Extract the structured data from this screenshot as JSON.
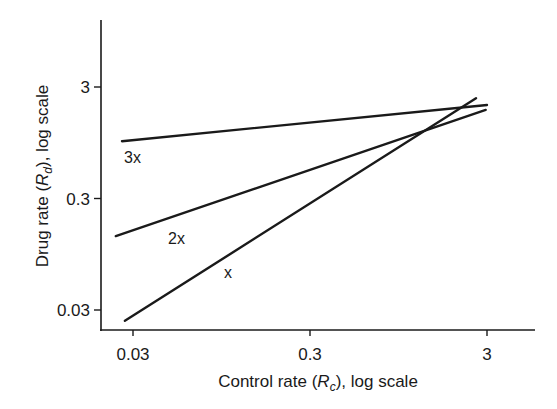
{
  "chart_data": {
    "type": "line",
    "title": "",
    "xlabel": "Control rate (R_c), log scale",
    "ylabel": "Drug rate (R_d), log scale",
    "xlabel_parts": {
      "prefix": "Control rate (",
      "var": "R",
      "sub": "c",
      "suffix": "), log scale"
    },
    "ylabel_parts": {
      "prefix": "Drug rate (",
      "var": "R",
      "sub": "d",
      "suffix": "), log scale"
    },
    "xscale": "log",
    "yscale": "log",
    "xlim": [
      0.02,
      7
    ],
    "ylim": [
      0.023,
      12
    ],
    "x_ticks": [
      0.03,
      0.3,
      3
    ],
    "x_tick_labels": [
      "0.03",
      "0.3",
      "3"
    ],
    "y_ticks": [
      0.03,
      0.3,
      3
    ],
    "y_tick_labels": [
      "0.03",
      "0.3",
      "3"
    ],
    "grid": false,
    "legend": "none (inline labels)",
    "series": [
      {
        "name": "3x",
        "label": "3x",
        "x": [
          0.026,
          3.0
        ],
        "y": [
          0.98,
          2.07
        ]
      },
      {
        "name": "2x",
        "label": "2x",
        "x": [
          0.024,
          2.95
        ],
        "y": [
          0.138,
          1.87
        ]
      },
      {
        "name": "x",
        "label": "x",
        "x": [
          0.027,
          2.6
        ],
        "y": [
          0.024,
          2.38
        ]
      }
    ]
  },
  "colors": {
    "line": "#1a1a1a",
    "background": "#ffffff"
  }
}
